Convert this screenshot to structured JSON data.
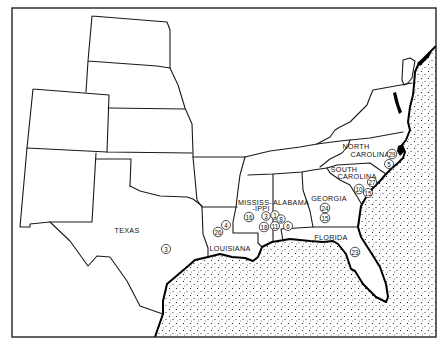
{
  "map": {
    "colors": {
      "ink": "#000000",
      "paper": "#ffffff",
      "water_dots": "#000000"
    },
    "state_labels": {
      "texas": "TEXAS",
      "louisiana": "LOUISIANA",
      "mississippi_1": "MISSISS-",
      "mississippi_2": "-IPPI",
      "alabama": "ALABAMA",
      "georgia": "GEORGIA",
      "florida": "FLORIDA",
      "north_carolina_1": "NORTH",
      "north_carolina_2": "CAROLINA",
      "south_carolina_1": "SOUTH",
      "south_carolina_2": "CAROLINA"
    },
    "markers": {
      "texas": [
        "3"
      ],
      "louisiana": [
        "26",
        "4"
      ],
      "mississippi": [
        "16",
        "3",
        "18"
      ],
      "alabama": [
        "1",
        "8",
        "11",
        "6"
      ],
      "georgia": [
        "24",
        "15"
      ],
      "florida": [
        "23"
      ],
      "north_carolina": [
        "29",
        "5"
      ],
      "south_carolina": [
        "27",
        "10",
        "15"
      ]
    }
  }
}
